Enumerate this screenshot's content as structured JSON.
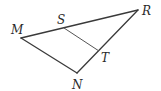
{
  "diagram": {
    "type": "geometry-triangle",
    "colors": {
      "line": "#3a3a3a",
      "label": "#2a2a2a",
      "background": "#ffffff"
    },
    "points": {
      "M": {
        "label": "M",
        "x": 21,
        "y": 38
      },
      "R": {
        "label": "R",
        "x": 138,
        "y": 10
      },
      "N": {
        "label": "N",
        "x": 77,
        "y": 73
      },
      "S": {
        "label": "S",
        "x": 64,
        "y": 28
      },
      "T": {
        "label": "T",
        "x": 99,
        "y": 51
      }
    },
    "segments": [
      {
        "from": "M",
        "to": "R"
      },
      {
        "from": "R",
        "to": "N"
      },
      {
        "from": "N",
        "to": "M"
      },
      {
        "from": "S",
        "to": "T"
      }
    ]
  }
}
